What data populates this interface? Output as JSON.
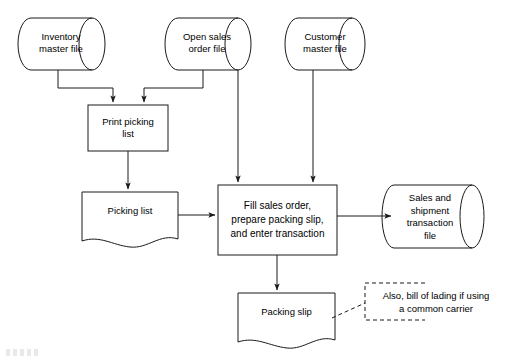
{
  "diagram": {
    "type": "flowchart",
    "stroke_color": "#1a1a1a",
    "fill_color": "#ffffff",
    "text_color": "#000000",
    "canvas": {
      "width": 507,
      "height": 360
    }
  },
  "nodes": {
    "inventory_master_file": {
      "label": "Inventory\nmaster file",
      "shape": "cylinder"
    },
    "open_sales_order_file": {
      "label": "Open sales\norder file",
      "shape": "cylinder"
    },
    "customer_master_file": {
      "label": "Customer\nmaster file",
      "shape": "cylinder"
    },
    "print_picking_list": {
      "label": "Print picking\nlist",
      "shape": "process"
    },
    "picking_list": {
      "label": "Picking list",
      "shape": "document"
    },
    "fill_sales_order": {
      "label": "Fill sales order,\nprepare packing slip,\nand enter transaction",
      "shape": "process"
    },
    "sales_shipment_transaction_file": {
      "label": "Sales and\nshipment\ntransaction\nfile",
      "shape": "cylinder"
    },
    "packing_slip": {
      "label": "Packing slip",
      "shape": "document"
    },
    "annotation": {
      "label": "Also, bill of lading if using\na common carrier",
      "shape": "annotation-bracket"
    }
  },
  "edges": [
    {
      "name": "inventory-to-print",
      "from": "inventory_master_file",
      "to": "print_picking_list",
      "arrow": true
    },
    {
      "name": "open-sales-to-print",
      "from": "open_sales_order_file",
      "to": "print_picking_list",
      "arrow": true
    },
    {
      "name": "open-sales-to-fill",
      "from": "open_sales_order_file",
      "to": "fill_sales_order",
      "arrow": true
    },
    {
      "name": "customer-to-fill",
      "from": "customer_master_file",
      "to": "fill_sales_order",
      "arrow": true
    },
    {
      "name": "print-to-picking-list",
      "from": "print_picking_list",
      "to": "picking_list",
      "arrow": true
    },
    {
      "name": "picking-list-to-fill",
      "from": "picking_list",
      "to": "fill_sales_order",
      "arrow": true
    },
    {
      "name": "fill-to-transaction-file",
      "from": "fill_sales_order",
      "to": "sales_shipment_transaction_file",
      "arrow": true
    },
    {
      "name": "fill-to-packing-slip",
      "from": "fill_sales_order",
      "to": "packing_slip",
      "arrow": true
    },
    {
      "name": "packing-slip-to-annotation",
      "from": "packing_slip",
      "to": "annotation",
      "arrow": false,
      "style": "dashed"
    }
  ]
}
